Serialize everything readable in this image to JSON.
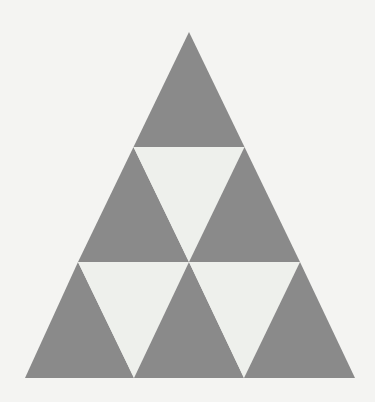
{
  "figure": {
    "description": "A large equilateral triangle divided into nine smaller triangles arranged in three rows; upward-pointing triangles are gray and downward-pointing triangles are light off-white.",
    "background_color": "#f4f4f2",
    "gray_color": "#8a8a8a",
    "light_color": "#eef0ec",
    "canvas": {
      "width": 375,
      "height": 402
    },
    "outer_triangle": {
      "apex_x": 189,
      "apex_y": 32,
      "bottom_left_x": 25,
      "bottom_left_y": 378,
      "bottom_right_x": 355,
      "bottom_right_y": 378,
      "base_width": 330,
      "height": 346,
      "rows": 3,
      "row_boundary_1_y": 147,
      "row_boundary_2_y": 262
    },
    "cells": [
      {
        "id": "r1-c1",
        "row": 1,
        "index": 1,
        "orientation": "up",
        "color_role": "gray",
        "points": "189,32 133.5,147 244.5,147"
      },
      {
        "id": "r2-c1",
        "row": 2,
        "index": 1,
        "orientation": "up",
        "color_role": "gray",
        "points": "133.5,147 78,262 189,262"
      },
      {
        "id": "r2-c2",
        "row": 2,
        "index": 2,
        "orientation": "down",
        "color_role": "light",
        "points": "133.5,147 244.5,147 189,262"
      },
      {
        "id": "r2-c3",
        "row": 2,
        "index": 3,
        "orientation": "up",
        "color_role": "gray",
        "points": "244.5,147 189,262 300,262"
      },
      {
        "id": "r3-c1",
        "row": 3,
        "index": 1,
        "orientation": "up",
        "color_role": "gray",
        "points": "78,262 25,378 134,378"
      },
      {
        "id": "r3-c2",
        "row": 3,
        "index": 2,
        "orientation": "down",
        "color_role": "light",
        "points": "78,262 189,262 134,378"
      },
      {
        "id": "r3-c3",
        "row": 3,
        "index": 3,
        "orientation": "up",
        "color_role": "gray",
        "points": "189,262 134,378 244,378"
      },
      {
        "id": "r3-c4",
        "row": 3,
        "index": 4,
        "orientation": "down",
        "color_role": "light",
        "points": "189,262 300,262 244,378"
      },
      {
        "id": "r3-c5",
        "row": 3,
        "index": 5,
        "orientation": "up",
        "color_role": "gray",
        "points": "300,262 244,378 355,378"
      }
    ],
    "counts": {
      "total_triangles": 9,
      "gray_triangles": 6,
      "light_triangles": 3
    }
  }
}
